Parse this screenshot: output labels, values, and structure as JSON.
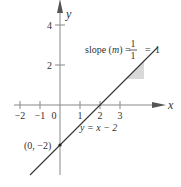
{
  "graph": {
    "equation_label": "y = x − 2",
    "slope": 1,
    "intercept": -2,
    "x_axis_label": "x",
    "y_axis_label": "y",
    "x_ticks": [
      -2,
      -1,
      0,
      1,
      2,
      3
    ],
    "x_tick_labels": [
      "−2",
      "−1",
      "0",
      "1",
      "2",
      "3"
    ],
    "y_ticks": [
      2,
      4
    ],
    "y_tick_labels": [
      "2",
      "4"
    ],
    "x_range": [
      -2.3,
      4.6
    ],
    "y_range": [
      -3.5,
      4.6
    ],
    "intercept_point_label": "(0, −2)",
    "slope_annotation": {
      "prefix": "slope (",
      "m": "m",
      "suffix": ") =",
      "numerator": "1",
      "denominator": "1",
      "equals": "=",
      "result": "1"
    },
    "slope_triangle": {
      "x_from": 3.3,
      "x_to": 4.2,
      "rise_note": "rise 1 over run 1",
      "fill": "#d9d9d9"
    },
    "colors": {
      "axis": "#888888",
      "line": "#333333",
      "text": "#333333"
    }
  }
}
